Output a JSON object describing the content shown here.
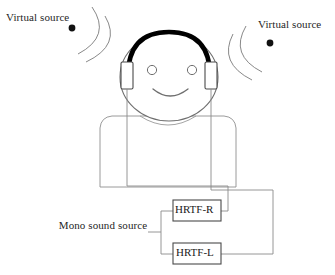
{
  "figure": {
    "background_color": "#ffffff",
    "line_color": "#8a8a8a",
    "outline_color": "#6f6f6f",
    "headband_color": "#000000",
    "dot_color": "#111111",
    "text_color": "#262626"
  },
  "labels": {
    "virtual_source_left": "Virtual source",
    "virtual_source_right": "Virtual source",
    "mono_source": "Mono sound source"
  },
  "blocks": [
    {
      "id": "hrtf-r",
      "label": "HRTF-R"
    },
    {
      "id": "hrtf-l",
      "label": "HRTF-L"
    }
  ],
  "elements": {
    "listener": "head-with-headphones",
    "left_virtual_source_dot": "sound-source-point",
    "right_virtual_source_dot": "sound-source-point",
    "wavefront_arcs_per_side": 2
  }
}
